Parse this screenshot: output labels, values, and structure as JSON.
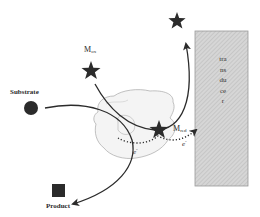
{
  "diagram": {
    "labels": {
      "substrate": "Substrate",
      "product": "Product",
      "mediator_ox_base": "M",
      "mediator_ox_sub": "ox",
      "mediator_red_base": "M",
      "mediator_red_sub": "red",
      "electron_1_base": "e",
      "electron_1_sup": "-",
      "electron_2_base": "e",
      "electron_2_sup": "-",
      "transducer": "transducer"
    },
    "colors": {
      "ink": "#2b2b2b",
      "enzyme_outline": "#a8a8a8",
      "enzyme_fill": "#f4f4f4",
      "transducer_fill": "#d4d4d4",
      "transducer_hatch": "#b8b8b8",
      "transducer_border": "#9a9a9a"
    },
    "elements": {
      "substrate_marker": "filled-circle",
      "product_marker": "filled-square",
      "mediator_ox_marker": "star",
      "mediator_red_marker": "star",
      "regenerated_mediator_marker": "star",
      "electron_path": "dotted-arrow"
    }
  }
}
